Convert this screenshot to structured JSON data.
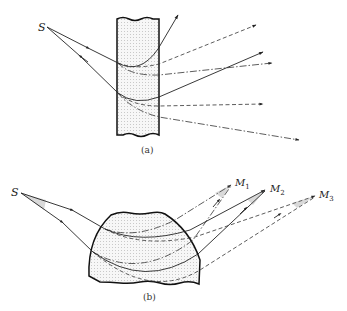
{
  "figure": {
    "panel_a": {
      "caption": "(a)",
      "source_label": "S",
      "medium": "plane slab"
    },
    "panel_b": {
      "caption": "(b)",
      "source_label": "S",
      "medium": "curved dome",
      "image_points": [
        {
          "label": "M",
          "subscript": "1"
        },
        {
          "label": "M",
          "subscript": "2"
        },
        {
          "label": "M",
          "subscript": "3"
        }
      ]
    },
    "colors": {
      "ink": "#222222",
      "medium_fill": "#efefef",
      "background": "#ffffff"
    }
  }
}
